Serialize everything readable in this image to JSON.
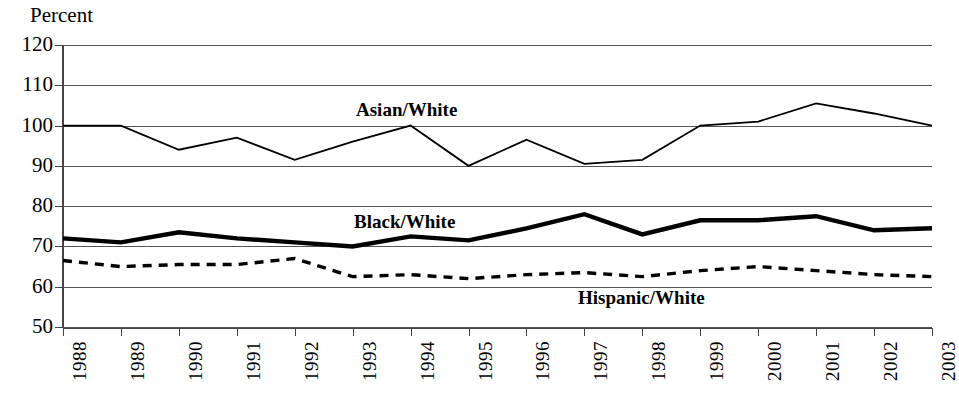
{
  "caption_sliver": "",
  "axis": {
    "y_title": "Percent",
    "y_ticks": [
      120,
      110,
      100,
      90,
      80,
      70,
      60,
      50
    ],
    "x_ticks": [
      "1988",
      "1989",
      "1990",
      "1991",
      "1992",
      "1993",
      "1994",
      "1995",
      "1996",
      "1997",
      "1998",
      "1999",
      "2000",
      "2001",
      "2002",
      "2003"
    ]
  },
  "series_labels": {
    "asian_white": "Asian/White",
    "black_white": "Black/White",
    "hispanic_white": "Hispanic/White"
  },
  "colors": {
    "line": "#000000",
    "grid": "#555555",
    "axis": "#444444",
    "background": "#ffffff"
  },
  "chart_data": {
    "type": "line",
    "title": "",
    "xlabel": "",
    "ylabel": "Percent",
    "ylim": [
      50,
      120
    ],
    "ytick_step": 10,
    "grid": true,
    "legend": "inline-labels",
    "x": [
      "1988",
      "1989",
      "1990",
      "1991",
      "1992",
      "1993",
      "1994",
      "1995",
      "1996",
      "1997",
      "1998",
      "1999",
      "2000",
      "2001",
      "2002",
      "2003"
    ],
    "series": [
      {
        "name": "Asian/White",
        "style": "thin-solid",
        "values": [
          100,
          100,
          94,
          97,
          91.5,
          96,
          100,
          90,
          96.5,
          90.5,
          91.5,
          100,
          101,
          105.5,
          103,
          100
        ]
      },
      {
        "name": "Black/White",
        "style": "thick-solid",
        "values": [
          72,
          71,
          73.5,
          72,
          71,
          70,
          72.5,
          71.5,
          74.5,
          78,
          73,
          76.5,
          76.5,
          77.5,
          74,
          74.5
        ]
      },
      {
        "name": "Hispanic/White",
        "style": "dashed",
        "values": [
          66.5,
          65,
          65.5,
          65.5,
          67,
          62.5,
          63,
          62,
          63,
          63.5,
          62.5,
          64,
          65,
          64,
          63,
          62.5
        ]
      }
    ]
  }
}
